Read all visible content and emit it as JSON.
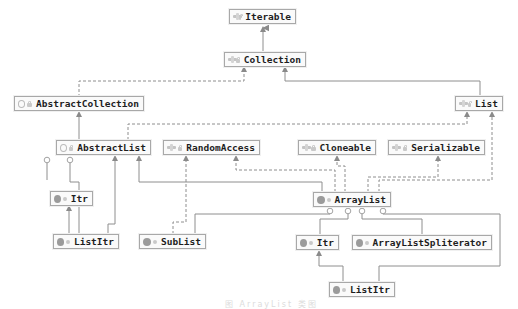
{
  "diagram": {
    "type": "UML class hierarchy",
    "subject": "ArrayList",
    "nodes": [
      {
        "id": "iterable",
        "label": "Iterable",
        "kind": "interface"
      },
      {
        "id": "collection",
        "label": "Collection",
        "kind": "interface"
      },
      {
        "id": "abstractcollection",
        "label": "AbstractCollection",
        "kind": "abstract-class"
      },
      {
        "id": "list",
        "label": "List",
        "kind": "interface"
      },
      {
        "id": "abstractlist",
        "label": "AbstractList",
        "kind": "abstract-class"
      },
      {
        "id": "randomaccess",
        "label": "RandomAccess",
        "kind": "interface"
      },
      {
        "id": "cloneable",
        "label": "Cloneable",
        "kind": "interface"
      },
      {
        "id": "serializable",
        "label": "Serializable",
        "kind": "interface"
      },
      {
        "id": "al_itr",
        "label": "Itr",
        "kind": "class"
      },
      {
        "id": "arraylist",
        "label": "ArrayList",
        "kind": "class"
      },
      {
        "id": "al_listitr",
        "label": "ListItr",
        "kind": "class"
      },
      {
        "id": "sublist",
        "label": "SubList",
        "kind": "class"
      },
      {
        "id": "itr",
        "label": "Itr",
        "kind": "class"
      },
      {
        "id": "spliterator",
        "label": "ArrayListSpliterator",
        "kind": "class"
      },
      {
        "id": "listitr",
        "label": "ListItr",
        "kind": "class"
      }
    ],
    "edges": [
      {
        "from": "Collection",
        "to": "Iterable",
        "type": "extends"
      },
      {
        "from": "AbstractCollection",
        "to": "Collection",
        "type": "implements"
      },
      {
        "from": "List",
        "to": "Collection",
        "type": "extends"
      },
      {
        "from": "AbstractList",
        "to": "AbstractCollection",
        "type": "extends"
      },
      {
        "from": "AbstractList",
        "to": "List",
        "type": "implements"
      },
      {
        "from": "ArrayList",
        "to": "AbstractList",
        "type": "extends"
      },
      {
        "from": "ArrayList",
        "to": "List",
        "type": "implements"
      },
      {
        "from": "ArrayList",
        "to": "RandomAccess",
        "type": "implements"
      },
      {
        "from": "ArrayList",
        "to": "Cloneable",
        "type": "implements"
      },
      {
        "from": "ArrayList",
        "to": "Serializable",
        "type": "implements"
      },
      {
        "from": "SubList",
        "to": "AbstractList",
        "type": "extends"
      },
      {
        "from": "SubList",
        "to": "RandomAccess",
        "type": "implements"
      },
      {
        "from": "ListItr",
        "to": "Itr",
        "type": "extends"
      },
      {
        "from": "Itr",
        "to": "AbstractList",
        "type": "inner-class"
      },
      {
        "from": "ListItr",
        "to": "AbstractList",
        "type": "inner-class"
      },
      {
        "from": "Itr",
        "to": "ArrayList",
        "type": "inner-class"
      },
      {
        "from": "SubList",
        "to": "ArrayList",
        "type": "inner-class"
      },
      {
        "from": "ArrayListSpliterator",
        "to": "ArrayList",
        "type": "inner-class"
      },
      {
        "from": "ListItr",
        "to": "ArrayList",
        "type": "inner-class"
      }
    ],
    "caption": "图 ArrayList 类图",
    "colors": {
      "line": "#8a8a8a",
      "box_border": "#a8a8a8",
      "text": "#1e1e1e",
      "background": "#ffffff"
    }
  }
}
